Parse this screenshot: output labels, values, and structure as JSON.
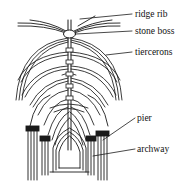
{
  "diagram": {
    "labels": [
      {
        "id": "ridge-rib",
        "text": "ridge rib",
        "x": 135,
        "y": 10
      },
      {
        "id": "stone-boss",
        "text": "stone boss",
        "x": 135,
        "y": 27
      },
      {
        "id": "tiercerons",
        "text": "tiercerons",
        "x": 135,
        "y": 48
      },
      {
        "id": "pier",
        "text": "pier",
        "x": 137,
        "y": 114
      },
      {
        "id": "archway",
        "text": "archway",
        "x": 137,
        "y": 145
      }
    ],
    "colors": {
      "ink": "#1a1a1a",
      "background": "#ffffff"
    }
  }
}
